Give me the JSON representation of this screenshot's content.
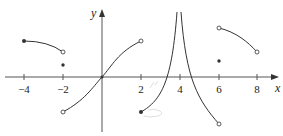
{
  "figure": {
    "axes": {
      "x_label": "x",
      "y_label": "y",
      "x_ticks": [
        "−4",
        "−2",
        "2",
        "4",
        "6",
        "8"
      ],
      "x_tick_values": [
        -4,
        -2,
        2,
        4,
        6,
        8
      ]
    },
    "pieces": [
      {
        "name": "piece-1",
        "domain": "[-4,-2)",
        "start": {
          "x": -4,
          "y": 2,
          "endpoint": "closed"
        },
        "end": {
          "x": -2,
          "y": 1.4,
          "endpoint": "open"
        }
      },
      {
        "name": "isolated-point-1",
        "x": -2,
        "y": 0.7,
        "endpoint": "closed"
      },
      {
        "name": "piece-2",
        "domain": "(-2,2)",
        "start": {
          "x": -2,
          "y": -2,
          "endpoint": "open"
        },
        "through": {
          "x": 0,
          "y": 0
        },
        "end": {
          "x": 2,
          "y": 2,
          "endpoint": "open"
        }
      },
      {
        "name": "piece-3",
        "domain": "[2,4)",
        "start": {
          "x": 2,
          "y": -2,
          "endpoint": "closed"
        },
        "asymptote": "x=4 (+inf)"
      },
      {
        "name": "piece-4",
        "domain": "(4,6)",
        "asymptote": "x=4 (+inf)",
        "end": {
          "x": 6,
          "y": -2.6,
          "endpoint": "open"
        }
      },
      {
        "name": "piece-5",
        "domain": "(6,8)",
        "start": {
          "x": 6,
          "y": 2.7,
          "endpoint": "open"
        },
        "end": {
          "x": 8,
          "y": 1.4,
          "endpoint": "open"
        }
      },
      {
        "name": "isolated-point-2",
        "x": 6,
        "y": 0.9,
        "endpoint": "closed"
      }
    ]
  }
}
